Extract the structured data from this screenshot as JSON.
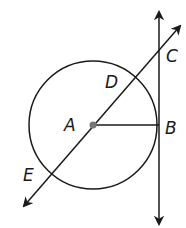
{
  "diagram": {
    "circle": {
      "center": "A",
      "cx": 93,
      "cy": 125,
      "r": 66
    },
    "points": [
      {
        "name": "A",
        "label": "A",
        "x": 93,
        "y": 125
      },
      {
        "name": "B",
        "label": "B",
        "x": 159,
        "y": 125
      },
      {
        "name": "C",
        "label": "C",
        "x": 159,
        "y": 50
      },
      {
        "name": "D",
        "label": "D",
        "x": 136,
        "y": 78
      },
      {
        "name": "E",
        "label": "E",
        "x": 50,
        "y": 175
      }
    ],
    "lines": [
      {
        "name": "tangent-line-BC",
        "type": "line",
        "through": [
          "B",
          "C"
        ]
      },
      {
        "name": "secant-line-EC",
        "type": "line",
        "through": [
          "E",
          "D",
          "A",
          "C"
        ]
      },
      {
        "name": "radius-AB",
        "type": "segment",
        "through": [
          "A",
          "B"
        ]
      }
    ],
    "colors": {
      "stroke": "#1a1a1a",
      "center_dot": "#777777"
    }
  }
}
